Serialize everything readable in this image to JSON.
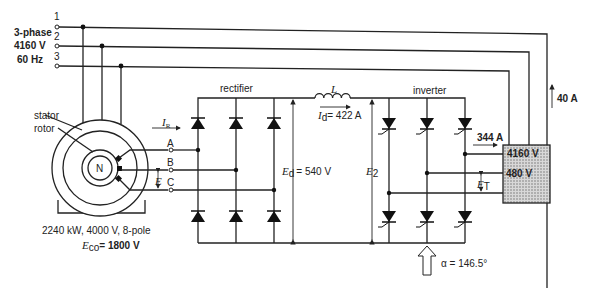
{
  "supply": {
    "terminals": [
      "1",
      "2",
      "3"
    ],
    "label_line1": "3-phase",
    "label_line2": "4160 V",
    "label_line3": "60 Hz"
  },
  "motor": {
    "stator_label": "stator",
    "rotor_label": "rotor",
    "pole_label": "N",
    "rating": "2240 kW, 4000 V, 8-pole",
    "eco_symbol": "E",
    "eco_sub": "co",
    "eco_value": "= 1800 V",
    "phases": [
      "A",
      "B",
      "C"
    ],
    "ir_symbol": "I",
    "ir_sub": "R",
    "e_symbol": "E"
  },
  "rectifier": {
    "title": "rectifier",
    "ed_symbol": "E",
    "ed_sub": "d",
    "ed_value": "=  540 V"
  },
  "dc_link": {
    "inductor_label": "L",
    "id_symbol": "I",
    "id_sub": "d",
    "id_value": "=  422 A"
  },
  "inverter": {
    "title": "inverter",
    "e2_symbol": "E",
    "e2_sub": "2",
    "alpha_label": "α = 146.5°"
  },
  "transformer": {
    "hv_label": "4160 V",
    "lv_label": "480 V",
    "current_in": "344 A",
    "current_out": "40 A",
    "et_symbol": "E",
    "et_sub": "T",
    "fill_color": "#b5b5b5"
  }
}
